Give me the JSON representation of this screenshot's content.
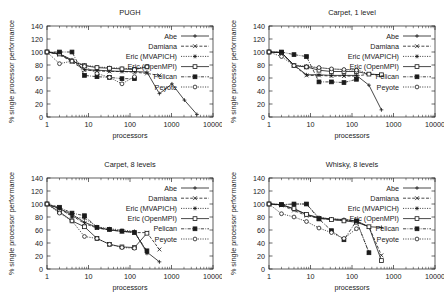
{
  "figure": {
    "background": "#ffffff",
    "ink_color": "#1a1a1a",
    "width": 444,
    "height": 304
  },
  "common": {
    "xlabel": "processors",
    "ylabel": "% single processor performance",
    "xticks": [
      "1",
      "10",
      "100",
      "1000",
      "10000"
    ],
    "yticks": [
      "0",
      "20",
      "40",
      "60",
      "80",
      "100",
      "120",
      "140"
    ],
    "xlim": [
      1,
      10000
    ],
    "ylim": [
      0,
      140
    ],
    "xscale": "log",
    "grid": false,
    "legend_position": "upper right"
  },
  "legend": {
    "entries": [
      {
        "label": "Abe",
        "marker": "plus",
        "dash": "solid"
      },
      {
        "label": "Damiana",
        "marker": "cross",
        "dash": "dashed"
      },
      {
        "label": "Eric (MVAPICH)",
        "marker": "star",
        "dash": "dotted"
      },
      {
        "label": "Eric (OpenMPI)",
        "marker": "open-square",
        "dash": "solid"
      },
      {
        "label": "Pelican",
        "marker": "filled-square",
        "dash": "dashdot"
      },
      {
        "label": "Peyote",
        "marker": "open-circle",
        "dash": "dotted"
      }
    ]
  },
  "chart_data": [
    {
      "type": "line",
      "title": "PUGH",
      "xlabel": "processors",
      "ylabel": "% single processor performance",
      "xscale": "log",
      "xlim": [
        1,
        10000
      ],
      "ylim": [
        0,
        140
      ],
      "series": [
        {
          "name": "Abe",
          "x": [
            1,
            2,
            4,
            8,
            16,
            32,
            64,
            128,
            256,
            512,
            1024,
            2048,
            4096
          ],
          "y": [
            100,
            97,
            88,
            73,
            72,
            71,
            70,
            70,
            69,
            36,
            51,
            26,
            4
          ]
        },
        {
          "name": "Damiana",
          "x": [
            1,
            2,
            4,
            8,
            16,
            32,
            64,
            128,
            256,
            512
          ],
          "y": [
            100,
            96,
            85,
            72,
            71,
            70,
            70,
            69,
            67,
            64
          ]
        },
        {
          "name": "Eric (MVAPICH)",
          "x": [
            1,
            2,
            4,
            8,
            16,
            32,
            64,
            128,
            256
          ],
          "y": [
            100,
            98,
            87,
            80,
            77,
            76,
            75,
            74,
            78
          ]
        },
        {
          "name": "Eric (OpenMPI)",
          "x": [
            1,
            2,
            4,
            8,
            16,
            32,
            64,
            128,
            256
          ],
          "y": [
            100,
            97,
            86,
            79,
            76,
            75,
            74,
            73,
            77
          ]
        },
        {
          "name": "Pelican",
          "x": [
            1,
            2,
            4,
            8,
            16,
            32,
            64,
            128
          ],
          "y": [
            100,
            100,
            100,
            64,
            62,
            61,
            59,
            59
          ]
        },
        {
          "name": "Peyote",
          "x": [
            1,
            2,
            4,
            8,
            16,
            32,
            64,
            128
          ],
          "y": [
            100,
            82,
            86,
            78,
            67,
            61,
            51,
            62
          ]
        }
      ]
    },
    {
      "type": "line",
      "title": "Carpet, 1 level",
      "xlabel": "processors",
      "ylabel": "% single processor performance",
      "xscale": "log",
      "xlim": [
        1,
        10000
      ],
      "ylim": [
        0,
        140
      ],
      "series": [
        {
          "name": "Abe",
          "x": [
            1,
            2,
            4,
            8,
            16,
            32,
            64,
            128,
            256,
            512
          ],
          "y": [
            100,
            99,
            80,
            65,
            65,
            64,
            64,
            64,
            49,
            11
          ]
        },
        {
          "name": "Damiana",
          "x": [
            1,
            2,
            4,
            8,
            16,
            32,
            64,
            128,
            256,
            512
          ],
          "y": [
            100,
            99,
            79,
            64,
            64,
            63,
            63,
            63,
            66,
            64
          ]
        },
        {
          "name": "Eric (MVAPICH)",
          "x": [
            1,
            2,
            4,
            8,
            16,
            32,
            64,
            128,
            256,
            512
          ],
          "y": [
            100,
            99,
            80,
            78,
            76,
            74,
            73,
            73,
            66,
            65
          ]
        },
        {
          "name": "Eric (OpenMPI)",
          "x": [
            1,
            2,
            4,
            8,
            16,
            32,
            64,
            128,
            256,
            512
          ],
          "y": [
            100,
            99,
            79,
            77,
            72,
            70,
            70,
            70,
            66,
            65
          ]
        },
        {
          "name": "Pelican",
          "x": [
            1,
            2,
            4,
            8,
            16,
            32,
            64,
            128
          ],
          "y": [
            100,
            100,
            96,
            93,
            54,
            54,
            53,
            58
          ]
        },
        {
          "name": "Peyote",
          "x": [
            1,
            2,
            4,
            8,
            16,
            32,
            64,
            128
          ],
          "y": [
            100,
            93,
            79,
            77,
            76,
            74,
            73,
            72
          ]
        }
      ]
    },
    {
      "type": "line",
      "title": "Carpet, 8 levels",
      "xlabel": "processors",
      "ylabel": "% single processor performance",
      "xscale": "log",
      "xlim": [
        1,
        10000
      ],
      "ylim": [
        0,
        140
      ],
      "series": [
        {
          "name": "Abe",
          "x": [
            1,
            2,
            4,
            8,
            16,
            32,
            64,
            128,
            256,
            512
          ],
          "y": [
            100,
            93,
            84,
            72,
            64,
            60,
            58,
            57,
            26,
            11
          ]
        },
        {
          "name": "Damiana",
          "x": [
            1,
            2,
            4,
            8,
            16,
            32,
            64,
            128,
            256,
            512
          ],
          "y": [
            100,
            92,
            82,
            70,
            63,
            60,
            58,
            56,
            56,
            30
          ]
        },
        {
          "name": "Eric (MVAPICH)",
          "x": [
            1,
            2,
            4,
            8,
            16,
            32,
            64,
            128,
            256
          ],
          "y": [
            100,
            94,
            80,
            78,
            65,
            62,
            60,
            58,
            24
          ]
        },
        {
          "name": "Eric (OpenMPI)",
          "x": [
            1,
            2,
            4,
            8,
            16,
            32,
            64,
            128,
            256
          ],
          "y": [
            100,
            88,
            74,
            65,
            47,
            38,
            34,
            33,
            55
          ]
        },
        {
          "name": "Pelican",
          "x": [
            1,
            2,
            4,
            8,
            16,
            32,
            64,
            128,
            256
          ],
          "y": [
            100,
            95,
            86,
            82,
            64,
            61,
            58,
            56,
            28
          ]
        },
        {
          "name": "Peyote",
          "x": [
            1,
            2,
            4,
            8,
            16,
            32,
            64,
            128
          ],
          "y": [
            100,
            86,
            74,
            50,
            47,
            38,
            33,
            32
          ]
        }
      ]
    },
    {
      "type": "line",
      "title": "Whisky, 8 levels",
      "xlabel": "processors",
      "ylabel": "% single processor performance",
      "xscale": "log",
      "xlim": [
        1,
        10000
      ],
      "ylim": [
        0,
        140
      ],
      "series": [
        {
          "name": "Abe",
          "x": [
            1,
            2,
            4,
            8,
            16,
            32,
            64,
            128,
            256,
            512
          ],
          "y": [
            100,
            99,
            92,
            84,
            79,
            77,
            76,
            74,
            65,
            64
          ]
        },
        {
          "name": "Damiana",
          "x": [
            1,
            2,
            4,
            8,
            16,
            32,
            64,
            128,
            256,
            512
          ],
          "y": [
            100,
            98,
            90,
            82,
            78,
            76,
            75,
            73,
            65,
            21
          ]
        },
        {
          "name": "Eric (MVAPICH)",
          "x": [
            1,
            2,
            4,
            8,
            16,
            32,
            64,
            128,
            256
          ],
          "y": [
            100,
            99,
            100,
            100,
            79,
            77,
            76,
            74,
            26
          ]
        },
        {
          "name": "Eric (OpenMPI)",
          "x": [
            1,
            2,
            4,
            8,
            16,
            32,
            64,
            128,
            256,
            512
          ],
          "y": [
            100,
            99,
            93,
            84,
            78,
            76,
            74,
            72,
            65,
            13
          ]
        },
        {
          "name": "Pelican",
          "x": [
            1,
            2,
            4,
            8,
            16,
            32,
            64,
            128,
            256
          ],
          "y": [
            100,
            99,
            100,
            100,
            77,
            59,
            45,
            74,
            25
          ]
        },
        {
          "name": "Peyote",
          "x": [
            1,
            2,
            4,
            8,
            16,
            32,
            64,
            128
          ],
          "y": [
            100,
            85,
            80,
            73,
            63,
            56,
            47,
            62
          ]
        }
      ]
    }
  ]
}
